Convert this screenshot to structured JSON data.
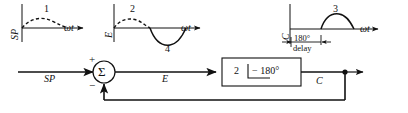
{
  "diagram": {
    "stroke_color": "#111111",
    "background": "#ffffff"
  },
  "plots": [
    {
      "id": "plot-1",
      "number": "1",
      "y_axis_label": "SP",
      "x_axis_label": "ωt",
      "waveform": {
        "style": "dashed",
        "description": "small positive half-sine hump above axis"
      }
    },
    {
      "id": "plot-2",
      "number": "2",
      "y_axis_label": "E",
      "x_axis_label": "ωt",
      "trough_label": "4",
      "waveform": {
        "style": "dashed-then-solid",
        "description": "dashed positive hump followed by solid negative trough"
      }
    },
    {
      "id": "plot-3",
      "number": "3",
      "y_axis_label": "C",
      "x_axis_label": "ωt",
      "annotation_top": "180°",
      "annotation_bottom": "delay",
      "waveform": {
        "style": "solid",
        "description": "solid positive half-sine hump shifted right by 180 degrees"
      }
    }
  ],
  "block_diagram": {
    "input_label": "SP",
    "summer": {
      "symbol": "Σ",
      "plus_sign": "+",
      "minus_sign": "−"
    },
    "error_label": "E",
    "block": {
      "gain": "2",
      "angle_bracket": "∠",
      "phase": "− 180°"
    },
    "output_label": "C"
  }
}
